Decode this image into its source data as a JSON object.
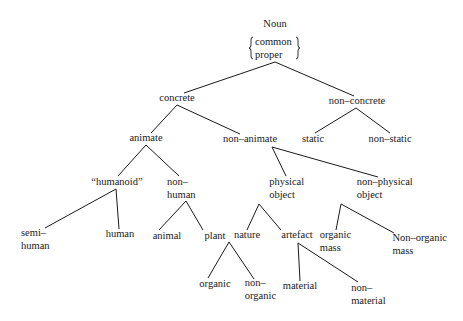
{
  "diagram": {
    "type": "tree",
    "root": {
      "label": "Noun",
      "sublabel": [
        "common",
        "proper"
      ]
    },
    "nodes": {
      "noun": {
        "lines": [
          "Noun"
        ],
        "x": 275,
        "y": 27
      },
      "concrete": {
        "lines": [
          "concrete"
        ],
        "x": 177,
        "y": 101
      },
      "non_concrete": {
        "lines": [
          "non–concrete"
        ],
        "x": 357,
        "y": 104
      },
      "animate": {
        "lines": [
          "animate"
        ],
        "x": 146,
        "y": 141
      },
      "non_animate": {
        "lines": [
          "non–animate"
        ],
        "x": 250,
        "y": 142
      },
      "static": {
        "lines": [
          "static"
        ],
        "x": 313,
        "y": 142
      },
      "non_static": {
        "lines": [
          "non–static"
        ],
        "x": 390,
        "y": 142
      },
      "humanoid": {
        "lines": [
          "“humanoid”"
        ],
        "x": 117,
        "y": 185
      },
      "non_human": {
        "lines": [
          "non–",
          "human"
        ],
        "x": 180,
        "y": 185
      },
      "physical_object": {
        "lines": [
          "physical",
          "object"
        ],
        "x": 290,
        "y": 185
      },
      "non_physical_object": {
        "lines": [
          "non–physical",
          "object"
        ],
        "x": 388,
        "y": 185
      },
      "semi_human": {
        "lines": [
          "semi–",
          "human"
        ],
        "x": 34,
        "y": 236
      },
      "human": {
        "lines": [
          "human"
        ],
        "x": 120,
        "y": 237
      },
      "animal": {
        "lines": [
          "animal"
        ],
        "x": 167,
        "y": 239
      },
      "plant": {
        "lines": [
          "plant"
        ],
        "x": 215,
        "y": 239
      },
      "nature": {
        "lines": [
          "nature"
        ],
        "x": 247,
        "y": 238
      },
      "artefact": {
        "lines": [
          "artefact"
        ],
        "x": 297,
        "y": 238
      },
      "organic_mass": {
        "lines": [
          "organic",
          "mass"
        ],
        "x": 338,
        "y": 238
      },
      "non_organic_mass": {
        "lines": [
          "Non–organic",
          "mass"
        ],
        "x": 421,
        "y": 241
      },
      "organic": {
        "lines": [
          "organic"
        ],
        "x": 215,
        "y": 287
      },
      "non_organic": {
        "lines": [
          "non–",
          "organic"
        ],
        "x": 263,
        "y": 286
      },
      "material": {
        "lines": [
          "material"
        ],
        "x": 300,
        "y": 289
      },
      "non_material": {
        "lines": [
          "non–",
          "material"
        ],
        "x": 372,
        "y": 291
      }
    },
    "edges": [
      {
        "from": "noun",
        "to": "concrete",
        "x1": 275,
        "y1": 62,
        "x2": 184,
        "y2": 93
      },
      {
        "from": "noun",
        "to": "non_concrete",
        "x1": 275,
        "y1": 62,
        "x2": 354,
        "y2": 96
      },
      {
        "from": "concrete",
        "to": "animate",
        "x1": 177,
        "y1": 105,
        "x2": 151,
        "y2": 133
      },
      {
        "from": "concrete",
        "to": "non_animate",
        "x1": 177,
        "y1": 105,
        "x2": 240,
        "y2": 134
      },
      {
        "from": "non_concrete",
        "to": "static",
        "x1": 356,
        "y1": 108,
        "x2": 315,
        "y2": 133
      },
      {
        "from": "non_concrete",
        "to": "non_static",
        "x1": 356,
        "y1": 108,
        "x2": 390,
        "y2": 133
      },
      {
        "from": "animate",
        "to": "humanoid",
        "x1": 146,
        "y1": 145,
        "x2": 118,
        "y2": 176
      },
      {
        "from": "animate",
        "to": "non_human",
        "x1": 146,
        "y1": 145,
        "x2": 179,
        "y2": 176
      },
      {
        "from": "non_animate",
        "to": "physical_object",
        "x1": 272,
        "y1": 147,
        "x2": 286,
        "y2": 176
      },
      {
        "from": "non_animate",
        "to": "non_physical_object",
        "x1": 272,
        "y1": 147,
        "x2": 378,
        "y2": 177
      },
      {
        "from": "humanoid",
        "to": "semi_human",
        "x1": 116,
        "y1": 189,
        "x2": 45,
        "y2": 228
      },
      {
        "from": "humanoid",
        "to": "human",
        "x1": 116,
        "y1": 189,
        "x2": 119,
        "y2": 229
      },
      {
        "from": "non_human",
        "to": "animal",
        "x1": 186,
        "y1": 201,
        "x2": 159,
        "y2": 230
      },
      {
        "from": "non_human",
        "to": "plant",
        "x1": 186,
        "y1": 201,
        "x2": 203,
        "y2": 230
      },
      {
        "from": "physical_object",
        "to": "nature",
        "x1": 259,
        "y1": 204,
        "x2": 247,
        "y2": 230
      },
      {
        "from": "physical_object",
        "to": "artefact",
        "x1": 259,
        "y1": 204,
        "x2": 281,
        "y2": 230
      },
      {
        "from": "non_physical_object",
        "to": "organic_mass",
        "x1": 341,
        "y1": 204,
        "x2": 336,
        "y2": 230
      },
      {
        "from": "non_physical_object",
        "to": "non_organic_mass",
        "x1": 341,
        "y1": 204,
        "x2": 394,
        "y2": 233
      },
      {
        "from": "nature",
        "to": "organic",
        "x1": 229,
        "y1": 242,
        "x2": 208,
        "y2": 278
      },
      {
        "from": "nature",
        "to": "non_organic",
        "x1": 229,
        "y1": 242,
        "x2": 254,
        "y2": 279
      },
      {
        "from": "artefact",
        "to": "material",
        "x1": 298,
        "y1": 243,
        "x2": 300,
        "y2": 281
      },
      {
        "from": "artefact",
        "to": "non_material",
        "x1": 298,
        "y1": 243,
        "x2": 358,
        "y2": 282
      }
    ]
  }
}
